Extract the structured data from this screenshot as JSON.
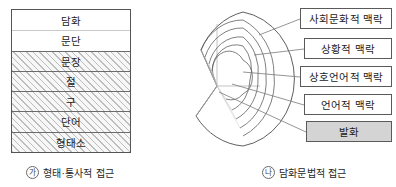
{
  "figure_left": {
    "name": "morpho-syntactic-approach-stack",
    "rows": [
      {
        "label": "담화",
        "style": "plain"
      },
      {
        "label": "문단",
        "style": "plain"
      },
      {
        "label": "문장",
        "style": "hatch"
      },
      {
        "label": "절",
        "style": "hatch"
      },
      {
        "label": "구",
        "style": "hatch"
      },
      {
        "label": "단어",
        "style": "hatch"
      },
      {
        "label": "형태소",
        "style": "hatch"
      }
    ],
    "caption": {
      "marker": "가",
      "text": "형태·통사적 접근"
    }
  },
  "figure_right": {
    "name": "discourse-grammar-approach-sphere",
    "labels": [
      {
        "label": "사회문화적 맥락",
        "shaded": false
      },
      {
        "label": "상황적 맥락",
        "shaded": false
      },
      {
        "label": "상호언어적 맥락",
        "shaded": false
      },
      {
        "label": "언어적 맥락",
        "shaded": false
      },
      {
        "label": "발화",
        "shaded": true
      }
    ],
    "caption": {
      "marker": "나",
      "text": "담화문법적 접근"
    }
  },
  "colors": {
    "outline": "#555555",
    "row_divider": "#6b6b6b",
    "hatch_line": "#bdbdbd",
    "hatch_background": "#f4f4f4",
    "shaded_box": "#d4d4d4",
    "page_background": "#ffffff",
    "text": "#1b1b1b"
  }
}
